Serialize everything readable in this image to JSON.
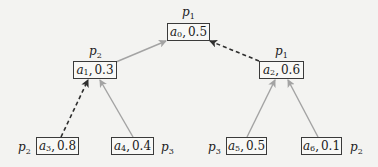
{
  "diagram": {
    "type": "tree",
    "background": "#f3f3f1",
    "colors": {
      "solid_edge": "#a3a3a3",
      "dashed_edge": "#2e2e2e",
      "node_border": "#3a3a3a"
    },
    "nodes": [
      {
        "id": "a0",
        "var": "a",
        "sub": "0",
        "value": "0.5",
        "player_var": "p",
        "player_sub": "1",
        "label_pos": "top"
      },
      {
        "id": "a1",
        "var": "a",
        "sub": "1",
        "value": "0.3",
        "player_var": "p",
        "player_sub": "2",
        "label_pos": "top"
      },
      {
        "id": "a2",
        "var": "a",
        "sub": "2",
        "value": "0.6",
        "player_var": "p",
        "player_sub": "1",
        "label_pos": "top"
      },
      {
        "id": "a3",
        "var": "a",
        "sub": "3",
        "value": "0.8",
        "player_var": "p",
        "player_sub": "2",
        "label_pos": "left"
      },
      {
        "id": "a4",
        "var": "a",
        "sub": "4",
        "value": "0.4",
        "player_var": "p",
        "player_sub": "3",
        "label_pos": "right"
      },
      {
        "id": "a5",
        "var": "a",
        "sub": "5",
        "value": "0.5",
        "player_var": "p",
        "player_sub": "3",
        "label_pos": "left"
      },
      {
        "id": "a6",
        "var": "a",
        "sub": "6",
        "value": "0.1",
        "player_var": "p",
        "player_sub": "2",
        "label_pos": "right"
      }
    ],
    "edges": [
      {
        "from": "a1",
        "to": "a0",
        "style": "solid"
      },
      {
        "from": "a2",
        "to": "a0",
        "style": "dashed"
      },
      {
        "from": "a3",
        "to": "a1",
        "style": "dashed"
      },
      {
        "from": "a4",
        "to": "a1",
        "style": "solid"
      },
      {
        "from": "a5",
        "to": "a2",
        "style": "solid"
      },
      {
        "from": "a6",
        "to": "a2",
        "style": "solid"
      }
    ]
  }
}
